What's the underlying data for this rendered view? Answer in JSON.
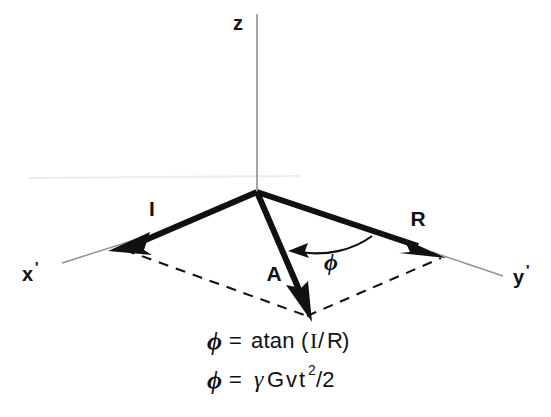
{
  "figure": {
    "kind": "vector-diagram",
    "background_color": "#ffffff",
    "ink_color": "#111111",
    "axis_line_color": "#8a8a8a",
    "artifact_line_color": "#e8e8e8"
  },
  "axes": {
    "z": {
      "label": "z",
      "prime": ""
    },
    "x_prime": {
      "label": "x",
      "prime": "'"
    },
    "y_prime": {
      "label": "y",
      "prime": "'"
    }
  },
  "vectors": [
    {
      "name": "I",
      "label": "I",
      "direction": "down-left",
      "style": "bold-solid-arrow"
    },
    {
      "name": "R",
      "label": "R",
      "direction": "down-right",
      "style": "bold-solid-arrow"
    },
    {
      "name": "A",
      "label": "A",
      "direction": "down",
      "style": "bold-solid-arrow"
    }
  ],
  "angle": {
    "symbol": "ϕ",
    "from_vector": "R",
    "to_vector": "A",
    "marker": "curved-arc-with-arrowhead"
  },
  "construction": {
    "parallelogram": "dashed",
    "dash_pattern": "10 8"
  },
  "equations": [
    {
      "id": "eq-phi-atan",
      "phi": "ϕ",
      "equals": "=",
      "rhs_prefix": "atan (",
      "numerator": "I",
      "slash": "/",
      "denominator": "R",
      "rhs_suffix": ")",
      "plain": "ϕ = atan (I/R)"
    },
    {
      "id": "eq-phi-gamma",
      "phi": "ϕ",
      "equals": "=",
      "gamma": "γ",
      "gradient": "G",
      "velocity": "v",
      "time": "t",
      "exponent": "2",
      "divide": "/2",
      "plain": "ϕ = γGvt²/2"
    }
  ]
}
